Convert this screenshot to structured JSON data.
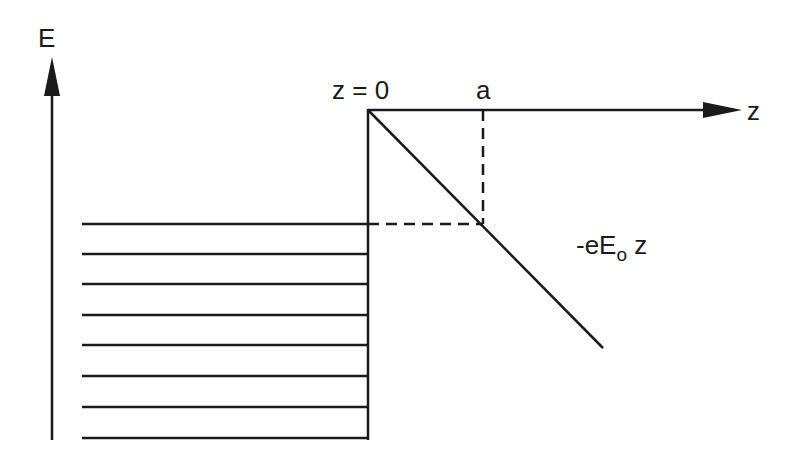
{
  "diagram": {
    "axes": {
      "vertical_label": "E",
      "horizontal_label": "z"
    },
    "labels": {
      "origin": "z = 0",
      "a": "a",
      "potential_prefix": "-eE",
      "potential_subscript": "o",
      "potential_suffix": " z"
    },
    "energy_levels_count": 8,
    "colors": {
      "line": "#1a1a1a",
      "background": "#ffffff"
    }
  }
}
